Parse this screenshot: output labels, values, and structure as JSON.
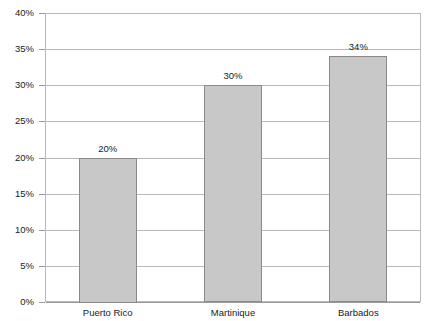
{
  "chart_data": {
    "type": "bar",
    "title": "",
    "subtitle": "",
    "xlabel": "",
    "ylabel": "",
    "categories": [
      "Puerto Rico",
      "Martinique",
      "Barbados"
    ],
    "values": [
      20,
      30,
      34
    ],
    "value_labels": [
      "20%",
      "30%",
      "34%"
    ],
    "ylim": [
      0,
      40
    ],
    "ytick_values": [
      0,
      5,
      10,
      15,
      20,
      25,
      30,
      35,
      40
    ],
    "ytick_labels": [
      "0%",
      "5%",
      "10%",
      "15%",
      "20%",
      "25%",
      "30%",
      "35%",
      "40%"
    ],
    "grid": true,
    "legend": false,
    "legend_position": "none",
    "colors": {
      "bar_fill": "#c8c8c8",
      "bar_border": "#8a8a8a",
      "gridline": "#b9b9b9",
      "frame": "#b9b9b9",
      "axis": "#9a9a9a",
      "text": "#1a1a1a",
      "background": "#ffffff"
    }
  }
}
